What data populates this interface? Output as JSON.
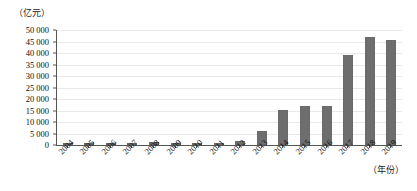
{
  "chart_data": {
    "type": "bar",
    "title": "",
    "subtitle": "",
    "xlabel": "（年份）",
    "ylabel": "（亿元）",
    "ylim": [
      0,
      50000
    ],
    "ytick_step": 5000,
    "grid": true,
    "legend": null,
    "bar_color": "#6e6e6e",
    "categories": [
      "2004",
      "2005",
      "2006",
      "2007",
      "2008",
      "2009",
      "2010",
      "2011",
      "2012",
      "2013",
      "2014",
      "2015",
      "2016",
      "2017",
      "2018",
      "2019"
    ],
    "values": [
      100,
      200,
      150,
      180,
      1200,
      300,
      250,
      700,
      1900,
      6100,
      15300,
      16800,
      17000,
      39300,
      47000,
      45700
    ],
    "ytick_labels": [
      "0",
      "5 000",
      "10 000",
      "15 000",
      "20 000",
      "25 000",
      "30 000",
      "35 000",
      "40 000",
      "45 000",
      "50 000"
    ],
    "ytick_values": [
      0,
      5000,
      10000,
      15000,
      20000,
      25000,
      30000,
      35000,
      40000,
      45000,
      50000
    ]
  }
}
